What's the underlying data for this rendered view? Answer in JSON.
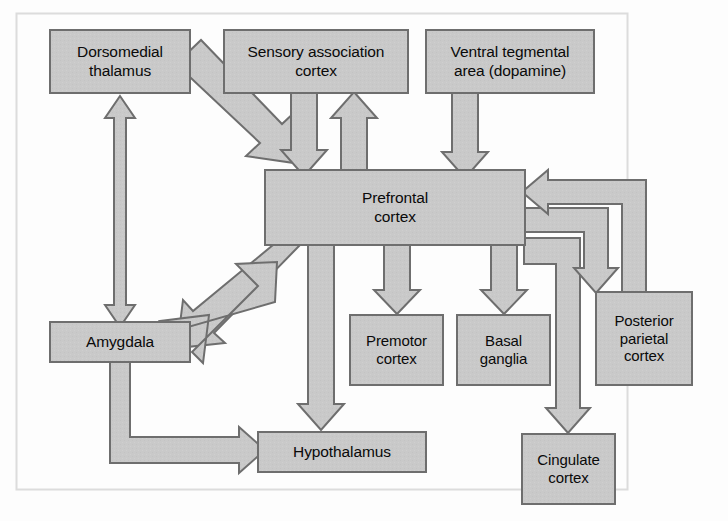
{
  "diagram": {
    "type": "block-flow-diagram",
    "style": {
      "box_fill": "#c8c8c8",
      "box_stroke": "#6e6e6e",
      "arrow_fill": "#c8c8c8",
      "arrow_stroke": "#6e6e6e",
      "text_color": "#0a0a0a",
      "frame_stroke": "#d8d8d8",
      "page_background": "#fdfdfd"
    },
    "frame": {
      "x": 16,
      "y": 13,
      "width": 612,
      "height": 477
    },
    "nodes": [
      {
        "id": "dorsomedial_thalamus",
        "label": "Dorsomedial\nthalamus",
        "x": 50,
        "y": 30,
        "width": 140,
        "height": 63
      },
      {
        "id": "sensory_association_cortex",
        "label": "Sensory association\ncortex",
        "x": 224,
        "y": 30,
        "width": 184,
        "height": 63
      },
      {
        "id": "ventral_tegmental_area",
        "label": "Ventral tegmental\narea (dopamine)",
        "x": 426,
        "y": 30,
        "width": 168,
        "height": 63
      },
      {
        "id": "prefrontal_cortex",
        "label": "Prefrontal\ncortex",
        "x": 265,
        "y": 170,
        "width": 260,
        "height": 75
      },
      {
        "id": "amygdala",
        "label": "Amygdala",
        "x": 50,
        "y": 322,
        "width": 140,
        "height": 40
      },
      {
        "id": "premotor_cortex",
        "label": "Premotor\ncortex",
        "x": 350,
        "y": 315,
        "width": 93,
        "height": 70
      },
      {
        "id": "basal_ganglia",
        "label": "Basal\nganglia",
        "x": 457,
        "y": 315,
        "width": 93,
        "height": 70
      },
      {
        "id": "posterior_parietal_cortex",
        "label": "Posterior\nparietal\ncortex",
        "x": 596,
        "y": 292,
        "width": 96,
        "height": 93
      },
      {
        "id": "hypothalamus",
        "label": "Hypothalamus",
        "x": 258,
        "y": 432,
        "width": 168,
        "height": 40
      },
      {
        "id": "cingulate_cortex",
        "label": "Cingulate\ncortex",
        "x": 522,
        "y": 434,
        "width": 93,
        "height": 70
      }
    ],
    "connections": [
      {
        "id": "thalamus-to-prefrontal",
        "from": "dorsomedial_thalamus",
        "to": "prefrontal_cortex",
        "direction": "one-way",
        "shape": "diagonal"
      },
      {
        "id": "thalamus-amygdala",
        "from": "dorsomedial_thalamus",
        "to": "amygdala",
        "direction": "two-way",
        "shape": "vertical"
      },
      {
        "id": "sensory-to-prefrontal",
        "from": "sensory_association_cortex",
        "to": "prefrontal_cortex",
        "direction": "one-way",
        "shape": "vertical"
      },
      {
        "id": "prefrontal-to-sensory",
        "from": "prefrontal_cortex",
        "to": "sensory_association_cortex",
        "direction": "one-way",
        "shape": "vertical"
      },
      {
        "id": "vta-to-prefrontal",
        "from": "ventral_tegmental_area",
        "to": "prefrontal_cortex",
        "direction": "one-way",
        "shape": "vertical"
      },
      {
        "id": "prefrontal-to-amygdala",
        "from": "prefrontal_cortex",
        "to": "amygdala",
        "direction": "one-way",
        "shape": "diagonal"
      },
      {
        "id": "amygdala-to-prefrontal",
        "from": "amygdala",
        "to": "prefrontal_cortex",
        "direction": "one-way",
        "shape": "diagonal"
      },
      {
        "id": "amygdala-to-hypothalamus",
        "from": "amygdala",
        "to": "hypothalamus",
        "direction": "one-way",
        "shape": "elbow"
      },
      {
        "id": "prefrontal-to-hypothalamus",
        "from": "prefrontal_cortex",
        "to": "hypothalamus",
        "direction": "one-way",
        "shape": "vertical"
      },
      {
        "id": "prefrontal-to-premotor",
        "from": "prefrontal_cortex",
        "to": "premotor_cortex",
        "direction": "one-way",
        "shape": "vertical"
      },
      {
        "id": "prefrontal-to-basal-ganglia",
        "from": "prefrontal_cortex",
        "to": "basal_ganglia",
        "direction": "one-way",
        "shape": "vertical"
      },
      {
        "id": "prefrontal-to-cingulate",
        "from": "prefrontal_cortex",
        "to": "cingulate_cortex",
        "direction": "one-way",
        "shape": "elbow"
      },
      {
        "id": "prefrontal-to-posterior-parietal",
        "from": "prefrontal_cortex",
        "to": "posterior_parietal_cortex",
        "direction": "one-way",
        "shape": "elbow"
      },
      {
        "id": "posterior-parietal-to-prefrontal",
        "from": "posterior_parietal_cortex",
        "to": "prefrontal_cortex",
        "direction": "one-way",
        "shape": "elbow"
      }
    ]
  }
}
